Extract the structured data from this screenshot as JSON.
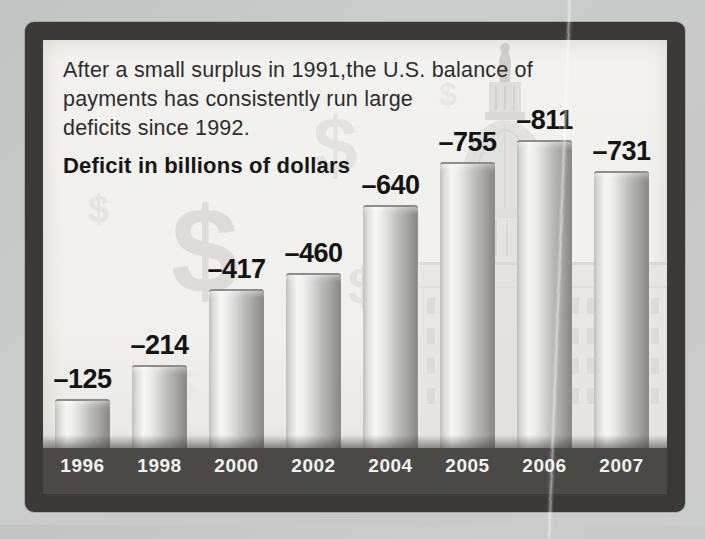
{
  "header": {
    "intro_line1": "After a small surplus in 1991,the U.S. balance of",
    "intro_line2": "payments has consistently run large",
    "intro_line3": "deficits since 1992.",
    "subtitle": "Deficit in billions of dollars"
  },
  "chart_data": {
    "type": "bar",
    "title": "Deficit in billions of dollars",
    "categories": [
      "1996",
      "1998",
      "2000",
      "2002",
      "2004",
      "2005",
      "2006",
      "2007"
    ],
    "values": [
      -125,
      -214,
      -417,
      -460,
      -640,
      -755,
      -811,
      -731
    ],
    "bar_labels": [
      "–125",
      "–214",
      "–417",
      "–460",
      "–640",
      "–755",
      "–811",
      "–731"
    ],
    "xlabel": "",
    "ylabel": "",
    "ylim": [
      -850,
      0
    ],
    "grid": false,
    "legend": "none"
  },
  "watermarks": {
    "dollar_symbol": "$",
    "background_image": "US Capitol dome silhouette"
  },
  "colors": {
    "outer_background": "#c8cac9",
    "frame": "#3a3937",
    "plot_background": "#f1f0ec",
    "axis_strip": "#4b4946",
    "intro_text": "#2d2d2d",
    "value_label": "#141414",
    "axis_label": "#f3f2ef",
    "watermark": "#dedcd8"
  }
}
